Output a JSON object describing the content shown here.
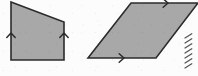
{
  "figure": {
    "canvas": {
      "width": 198,
      "height": 76
    },
    "colors": {
      "background": "#fcfcfc",
      "shape_fill": "#a8a8a8",
      "shape_stroke": "#2b2b2b",
      "arrow_stroke": "#2b2b2b",
      "hatch_stroke": "#555555"
    },
    "stroke_width": 1.6
  },
  "shapes": [
    {
      "id": "quadrilateral",
      "label": "right trapezoid",
      "points": "11,2 64,22 64,60 11,60",
      "fill": "#a8a8a8",
      "stroke": "#2b2b2b",
      "vertices": [
        {
          "name": "top-left",
          "x": 11,
          "y": 2
        },
        {
          "name": "top-right",
          "x": 64,
          "y": 22
        },
        {
          "name": "bottom-right",
          "x": 64,
          "y": 60
        },
        {
          "name": "bottom-left",
          "x": 11,
          "y": 60
        }
      ]
    },
    {
      "id": "parallelogram",
      "label": "parallelogram",
      "points": "88,58 131,3 198,3 156,58",
      "fill": "#a8a8a8",
      "stroke": "#2b2b2b",
      "vertices": [
        {
          "name": "bottom-left",
          "x": 88,
          "y": 58
        },
        {
          "name": "top-left",
          "x": 131,
          "y": 3
        },
        {
          "name": "top-right",
          "x": 198,
          "y": 3
        },
        {
          "name": "bottom-right",
          "x": 156,
          "y": 58
        }
      ]
    }
  ],
  "arrow_marks": [
    {
      "id": "arrow-quad-left",
      "shape": "quadrilateral",
      "edge": "left-vertical",
      "direction": "up",
      "x": 11,
      "y": 33,
      "angle": -90
    },
    {
      "id": "arrow-quad-right",
      "shape": "quadrilateral",
      "edge": "right-vertical",
      "direction": "up",
      "x": 64,
      "y": 33,
      "angle": -90
    },
    {
      "id": "arrow-para-top",
      "shape": "parallelogram",
      "edge": "top-horizontal",
      "direction": "right",
      "x": 168,
      "y": 3,
      "angle": 0
    },
    {
      "id": "arrow-para-bottom",
      "shape": "parallelogram",
      "edge": "bottom-horizontal",
      "direction": "right",
      "x": 124,
      "y": 58,
      "angle": 0
    }
  ],
  "margin_hatch_marks": {
    "id": "right-margin-hatching",
    "description": "partial diagonal tick marks from an adjacent cropped figure",
    "count": 7,
    "x": 185,
    "y_start": 38,
    "y_step": 5,
    "length": 8,
    "slant": -32
  }
}
